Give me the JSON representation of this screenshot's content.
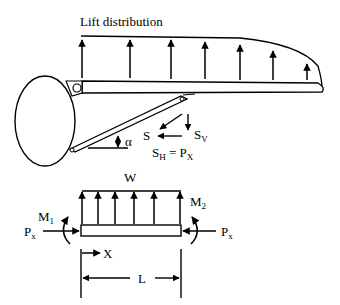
{
  "labels": {
    "title": "Lift distribution",
    "S": "S",
    "Sv_main": "S",
    "Sv_sub": "V",
    "Sh_main": "S",
    "Sh_sub": "H",
    "Sh_eq": " = P",
    "Sh_eq_sub": "X",
    "alpha": "α",
    "W": "W",
    "M1_main": "M",
    "M1_sub": "1",
    "M2_main": "M",
    "M2_sub": "2",
    "Px_left_main": "P",
    "Px_left_sub": "x",
    "Px_right_main": "P",
    "Px_right_sub": "x",
    "X": "X",
    "L": "L"
  },
  "colors": {
    "ink": "#000000",
    "background": "#ffffff"
  }
}
